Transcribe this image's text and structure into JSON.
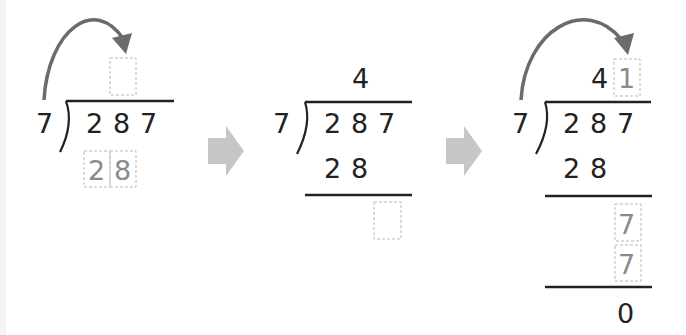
{
  "colors": {
    "digit": "#222222",
    "hint_digit": "#8a8a8a",
    "curve_arrow": "#6b6b6b",
    "step_arrow": "#c6c6c6",
    "dashed_box": "#b9b9b9"
  },
  "panels": [
    {
      "step": 1,
      "divisor": "7",
      "dividend": [
        "2",
        "8",
        "7"
      ],
      "quotient": [
        "",
        ""
      ],
      "quotient_box_empty": true,
      "hint_product": [
        "2",
        "8"
      ],
      "has_bring_down_arrow": true
    },
    {
      "step": 2,
      "divisor": "7",
      "dividend": [
        "2",
        "8",
        "7"
      ],
      "quotient": [
        "4"
      ],
      "product": [
        "2",
        "8"
      ],
      "remainder_box_empty": true
    },
    {
      "step": 3,
      "divisor": "7",
      "dividend": [
        "2",
        "8",
        "7"
      ],
      "quotient": [
        "4",
        "1"
      ],
      "product": [
        "2",
        "8"
      ],
      "brought_down": "7",
      "second_product": "7",
      "remainder": "0",
      "has_bring_down_arrow": true
    }
  ],
  "step_arrows": [
    "arrow-right-icon",
    "arrow-right-icon"
  ]
}
